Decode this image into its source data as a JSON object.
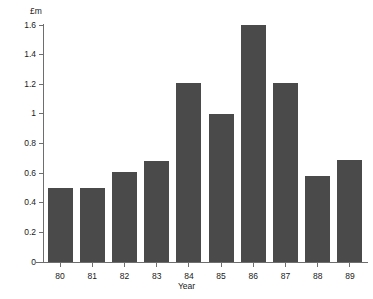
{
  "chart_data": {
    "type": "bar",
    "title": "",
    "subtitle": "",
    "xlabel": "Year",
    "ylabel": "£m",
    "categories": [
      "80",
      "81",
      "82",
      "83",
      "84",
      "85",
      "86",
      "87",
      "88",
      "89"
    ],
    "values": [
      0.5,
      0.5,
      0.61,
      0.68,
      1.21,
      1.0,
      1.6,
      1.21,
      0.58,
      0.69
    ],
    "series": [
      {
        "name": "",
        "values": [
          0.5,
          0.5,
          0.61,
          0.68,
          1.21,
          1.0,
          1.6,
          1.21,
          0.58,
          0.69
        ]
      }
    ],
    "ylim": [
      0,
      1.6
    ],
    "ytick_labels": [
      "0",
      "0.2",
      "0.4",
      "0.6",
      "0.8",
      "1",
      "1.2",
      "1.4",
      "1.6"
    ],
    "ytick_values": [
      0,
      0.2,
      0.4,
      0.6,
      0.8,
      1.0,
      1.2,
      1.4,
      1.6
    ],
    "xtick_labels": [
      "80",
      "81",
      "82",
      "83",
      "84",
      "85",
      "86",
      "87",
      "88",
      "89"
    ],
    "grid": false,
    "legend": false,
    "legend_position": "none",
    "annotations": [],
    "bar_color": "#4a4a4a",
    "axis_color": "#6e6e6e",
    "background_color": "#ffffff",
    "text_color": "#1a1a1a"
  }
}
